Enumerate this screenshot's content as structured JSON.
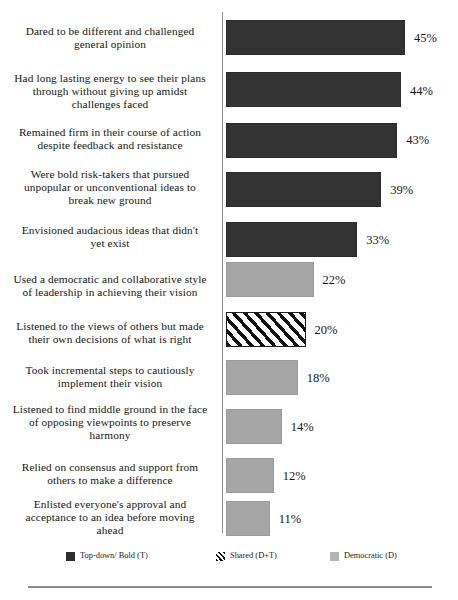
{
  "chart_data": {
    "type": "bar",
    "orientation": "horizontal",
    "title": "",
    "xlabel": "",
    "ylabel": "",
    "xlim": [
      0,
      50
    ],
    "grid": false,
    "legend_position": "bottom",
    "value_suffix": "%",
    "categories": [
      "Dared to be different and challenged general opinion",
      "Had long lasting energy to see their plans through without giving up  amidst challenges faced",
      "Remained firm in their course of action despite feedback and resistance",
      "Were bold risk-takers that pursued unpopular or unconventional ideas to break new ground",
      "Envisioned audacious  ideas that didn't yet exist",
      "Used a democratic and collaborative style of leadership  in achieving their vision",
      "Listened to the views of others but made their own decisions of what is right",
      "Took incremental steps to cautiously implement their vision",
      "Listened to find middle ground in the face of opposing viewpoints  to preserve harmony",
      "Relied on consensus and support from others to make a difference",
      "Enlisted everyone's approval and acceptance to an idea before moving ahead"
    ],
    "values": [
      45,
      44,
      43,
      39,
      33,
      22,
      20,
      18,
      14,
      12,
      11
    ],
    "series_of_point": [
      "topdown",
      "topdown",
      "topdown",
      "topdown",
      "topdown",
      "democratic",
      "shared",
      "democratic",
      "democratic",
      "democratic",
      "democratic"
    ],
    "legend": [
      {
        "key": "topdown",
        "label": "Top-down/ Bold (T)",
        "color": "#2e2e2e",
        "pattern": "solid"
      },
      {
        "key": "shared",
        "label": "Shared (D+T)",
        "color": "#111111",
        "pattern": "diagonal-hatch"
      },
      {
        "key": "democratic",
        "label": "Democratic (D)",
        "color": "#b4b4b4",
        "pattern": "solid"
      }
    ]
  },
  "rows": [
    {
      "label_lines": [
        "Dared to be different and challenged",
        "general opinion"
      ],
      "value_text": "45%",
      "value": 45,
      "series": "topdown",
      "label_top": 25,
      "bar_top": 20,
      "value_top": 31
    },
    {
      "label_lines": [
        "Had long lasting energy to see their plans",
        "through without giving up  amidst",
        "challenges faced"
      ],
      "value_text": "44%",
      "value": 44,
      "series": "topdown",
      "label_top": 72,
      "bar_top": 72,
      "value_top": 84
    },
    {
      "label_lines": [
        "Remained firm in their course of action",
        "despite feedback and resistance"
      ],
      "value_text": "43%",
      "value": 43,
      "series": "topdown",
      "label_top": 126,
      "bar_top": 123,
      "value_top": 133
    },
    {
      "label_lines": [
        "Were bold risk-takers that pursued",
        "unpopular or unconventional ideas to",
        "break new ground"
      ],
      "value_text": "39%",
      "value": 39,
      "series": "topdown",
      "label_top": 168,
      "bar_top": 172,
      "value_top": 183
    },
    {
      "label_lines": [
        "Envisioned audacious  ideas that didn't",
        "yet exist"
      ],
      "value_text": "33%",
      "value": 33,
      "series": "topdown",
      "label_top": 224,
      "bar_top": 222,
      "value_top": 233
    },
    {
      "label_lines": [
        "Used a democratic and collaborative style",
        "of leadership  in achieving their vision"
      ],
      "value_text": "22%",
      "value": 22,
      "series": "democratic",
      "label_top": 273,
      "bar_top": 262,
      "value_top": 273
    },
    {
      "label_lines": [
        "Listened to the views of others but made",
        "their own decisions of what is right"
      ],
      "value_text": "20%",
      "value": 20,
      "series": "shared",
      "label_top": 320,
      "bar_top": 312,
      "value_top": 323
    },
    {
      "label_lines": [
        "Took incremental steps to cautiously",
        "implement their vision"
      ],
      "value_text": "18%",
      "value": 18,
      "series": "democratic",
      "label_top": 364,
      "bar_top": 360,
      "value_top": 371
    },
    {
      "label_lines": [
        "Listened to find middle ground in the face",
        "of opposing viewpoints  to preserve",
        "harmony"
      ],
      "value_text": "14%",
      "value": 14,
      "series": "democratic",
      "label_top": 403,
      "bar_top": 409,
      "value_top": 420
    },
    {
      "label_lines": [
        "Relied on consensus and support from",
        "others to make a difference"
      ],
      "value_text": "12%",
      "value": 12,
      "series": "democratic",
      "label_top": 461,
      "bar_top": 458,
      "value_top": 469
    },
    {
      "label_lines": [
        "Enlisted everyone's approval and",
        "acceptance to an idea before moving",
        "ahead"
      ],
      "value_text": "11%",
      "value": 11,
      "series": "democratic",
      "label_top": 498,
      "bar_top": 501,
      "value_top": 512
    }
  ],
  "footer": {
    "caption": ""
  }
}
